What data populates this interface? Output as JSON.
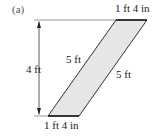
{
  "figure": {
    "part_label": "(a)",
    "height_label": "4 ft",
    "top_width_label": "1 ft 4 in",
    "bottom_width_label": "1 ft 4 in",
    "left_side_label": "5 ft",
    "right_side_label": "5 ft",
    "fill_color": "#e6e6e6",
    "edge_color": "#222222",
    "guide_color": "#888888"
  }
}
